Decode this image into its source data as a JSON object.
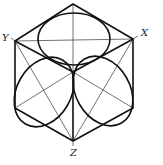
{
  "diagram": {
    "labels": {
      "x": "X",
      "y": "Y",
      "z": "Z"
    },
    "colors": {
      "stroke": "#111111",
      "thin": "#333333",
      "background": "#ffffff"
    },
    "vertices": {
      "top": [
        73,
        4
      ],
      "upper_left": [
        15,
        41
      ],
      "upper_right": [
        133,
        39
      ],
      "lower_left": [
        15,
        108
      ],
      "lower_right": [
        133,
        108
      ],
      "bottom": [
        73,
        141
      ],
      "center": [
        73,
        72
      ]
    },
    "faces": [
      "top",
      "left",
      "right"
    ],
    "ellipses": [
      {
        "face": "top",
        "cx": 74,
        "cy": 39,
        "rx": 36,
        "ry": 26,
        "rotate": 0
      },
      {
        "face": "left",
        "cx": 44,
        "cy": 90,
        "rx": 35,
        "ry": 27,
        "rotate": -60
      },
      {
        "face": "right",
        "cx": 103,
        "cy": 90,
        "rx": 35,
        "ry": 27,
        "rotate": 60
      }
    ]
  }
}
